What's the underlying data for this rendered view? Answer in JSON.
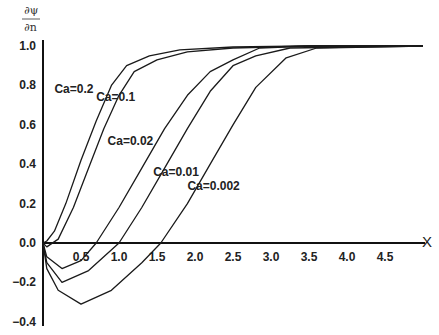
{
  "chart_data": {
    "type": "line",
    "title": "",
    "xlabel": "X",
    "ylabel_top": "∂ψ",
    "ylabel_bottom": "∂n",
    "xlim": [
      0,
      5
    ],
    "ylim": [
      -0.4,
      1.0
    ],
    "grid": false,
    "legend": "inline labels",
    "x_ticks": [
      "0.5",
      "1.0",
      "1.5",
      "2.0",
      "2.5",
      "3.0",
      "3.5",
      "4.0",
      "4.5"
    ],
    "y_ticks": [
      "1.0",
      "0.8",
      "0.6",
      "0.4",
      "0.2",
      "0.0",
      "-0.2",
      "-0.4"
    ],
    "series": [
      {
        "name": "Ca=0.2",
        "x": [
          0,
          0.05,
          0.15,
          0.3,
          0.5,
          0.7,
          0.9,
          1.1,
          1.4,
          1.8,
          2.5,
          3.5,
          5.0
        ],
        "y": [
          0,
          0.01,
          0.06,
          0.2,
          0.42,
          0.62,
          0.8,
          0.9,
          0.95,
          0.98,
          0.995,
          1.0,
          1.0
        ]
      },
      {
        "name": "Ca=0.1",
        "x": [
          0,
          0.05,
          0.2,
          0.4,
          0.6,
          0.8,
          1.0,
          1.2,
          1.5,
          1.9,
          2.5,
          3.5,
          5.0
        ],
        "y": [
          0,
          -0.02,
          0.02,
          0.18,
          0.38,
          0.58,
          0.75,
          0.87,
          0.93,
          0.97,
          0.99,
          1.0,
          1.0
        ]
      },
      {
        "name": "Ca=0.02",
        "x": [
          0,
          0.05,
          0.25,
          0.5,
          0.7,
          1.0,
          1.3,
          1.6,
          1.9,
          2.2,
          2.5,
          2.85,
          3.5,
          5.0
        ],
        "y": [
          0,
          -0.07,
          -0.13,
          -0.09,
          0.0,
          0.18,
          0.38,
          0.58,
          0.75,
          0.87,
          0.93,
          0.99,
          1.0,
          1.0
        ]
      },
      {
        "name": "Ca=0.01",
        "x": [
          0,
          0.05,
          0.25,
          0.6,
          1.0,
          1.3,
          1.6,
          1.9,
          2.2,
          2.5,
          2.8,
          3.25,
          5.0
        ],
        "y": [
          0,
          -0.1,
          -0.2,
          -0.14,
          0.0,
          0.18,
          0.38,
          0.58,
          0.77,
          0.9,
          0.95,
          0.99,
          1.0
        ]
      },
      {
        "name": "Ca=0.002",
        "x": [
          0,
          0.05,
          0.2,
          0.5,
          0.9,
          1.3,
          1.55,
          1.9,
          2.2,
          2.5,
          2.8,
          3.2,
          3.6,
          5.0
        ],
        "y": [
          0,
          -0.13,
          -0.24,
          -0.31,
          -0.24,
          -0.1,
          0.0,
          0.2,
          0.4,
          0.6,
          0.79,
          0.94,
          0.99,
          1.0
        ]
      }
    ],
    "annotations": [
      {
        "text": "Ca=0.2",
        "x": 0.15,
        "y": 0.76
      },
      {
        "text": "Ca=0.1",
        "x": 0.7,
        "y": 0.72
      },
      {
        "text": "Ca=0.02",
        "x": 0.85,
        "y": 0.5
      },
      {
        "text": "Ca=0.01",
        "x": 1.45,
        "y": 0.34
      },
      {
        "text": "Ca=0.002",
        "x": 1.9,
        "y": 0.27
      }
    ]
  },
  "style": {
    "line_color": "#1a1a1a",
    "axis_color": "#111111",
    "background": "#ffffff"
  }
}
